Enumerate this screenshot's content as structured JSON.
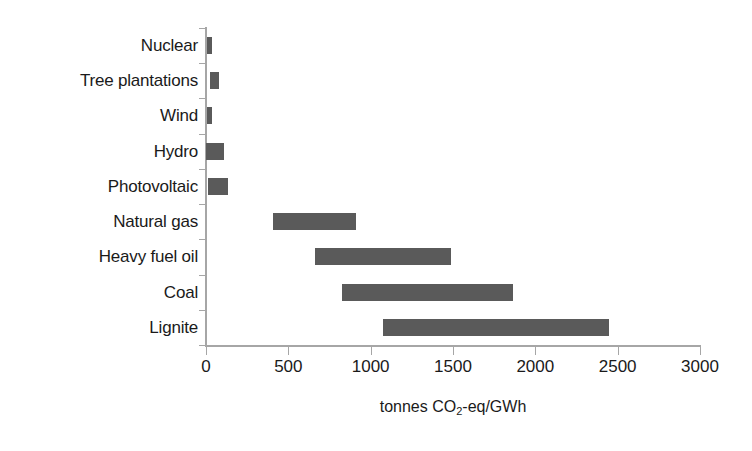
{
  "chart_data": {
    "type": "bar",
    "subtype": "floating-range-bar",
    "title": "",
    "subtitle": "",
    "xlabel": "tonnes CO2-eq/GWh",
    "xlabel_parts": {
      "prefix": "tonnes CO",
      "sub": "2",
      "suffix": "-eq/GWh"
    },
    "ylabel": "",
    "orientation": "horizontal",
    "categories": [
      "Nuclear",
      "Tree plantations",
      "Wind",
      "Hydro",
      "Photovoltaic",
      "Natural gas",
      "Heavy fuel oil",
      "Coal",
      "Lignite"
    ],
    "ranges": [
      {
        "category": "Nuclear",
        "low": 5,
        "high": 35
      },
      {
        "category": "Tree plantations",
        "low": 25,
        "high": 80
      },
      {
        "category": "Wind",
        "low": 8,
        "high": 35
      },
      {
        "category": "Hydro",
        "low": 0,
        "high": 110
      },
      {
        "category": "Photovoltaic",
        "low": 15,
        "high": 135
      },
      {
        "category": "Natural gas",
        "low": 405,
        "high": 910
      },
      {
        "category": "Heavy fuel oil",
        "low": 660,
        "high": 1490
      },
      {
        "category": "Coal",
        "low": 825,
        "high": 1865
      },
      {
        "category": "Lignite",
        "low": 1075,
        "high": 2450
      }
    ],
    "xlim": [
      0,
      3000
    ],
    "xticks": [
      0,
      500,
      1000,
      1500,
      2000,
      2500,
      3000
    ],
    "xticklabels": [
      "0",
      "500",
      "1000",
      "1500",
      "2000",
      "2500",
      "3000"
    ],
    "grid": false,
    "legend": null,
    "bar_color": "#5a5a5a",
    "axis_color": "#a6a6a6",
    "background_color": "#ffffff"
  }
}
